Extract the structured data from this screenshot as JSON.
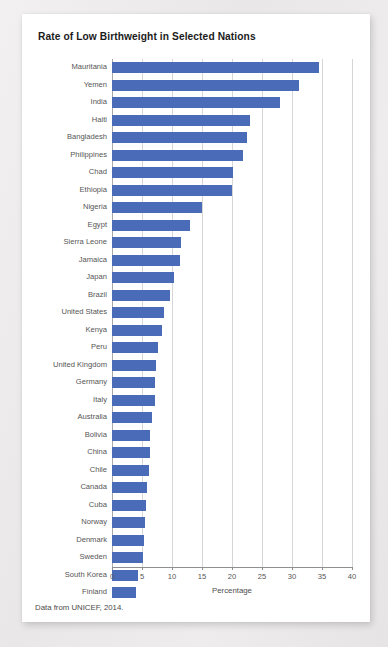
{
  "card": {
    "title": "Rate of Low Birthweight in Selected Nations",
    "source_note": "Data from UNICEF, 2014."
  },
  "colors": {
    "bar": "#4a6cb8",
    "grid": "#d6d6d6",
    "axis": "#8f8f8f",
    "label_text": "#555555",
    "card_background": "#ffffff",
    "page_background": "#eceaea"
  },
  "chart_data": {
    "type": "bar",
    "orientation": "horizontal",
    "title": "Rate of Low Birthweight in Selected Nations",
    "xlabel": "Percentage",
    "ylabel": "",
    "xlim": [
      0,
      40
    ],
    "xticks": [
      0,
      5,
      10,
      15,
      20,
      25,
      30,
      35,
      40
    ],
    "xtick_labels": [
      "0",
      "5",
      "10",
      "15",
      "20",
      "25",
      "30",
      "35",
      "40"
    ],
    "grid": "vertical",
    "legend": "none",
    "series_name": "Low birthweight rate",
    "categories": [
      "Mauritania",
      "Yemen",
      "India",
      "Haiti",
      "Bangladesh",
      "Philippines",
      "Chad",
      "Ethiopia",
      "Nigeria",
      "Egypt",
      "Sierra Leone",
      "Jamaica",
      "Japan",
      "Brazil",
      "United States",
      "Kenya",
      "Peru",
      "United Kingdom",
      "Germany",
      "Italy",
      "Australia",
      "Bolivia",
      "China",
      "Chile",
      "Canada",
      "Cuba",
      "Norway",
      "Denmark",
      "Sweden",
      "South Korea",
      "Finland"
    ],
    "values": [
      34.5,
      31.2,
      28.0,
      23.0,
      22.5,
      21.8,
      20.2,
      20.0,
      15.0,
      13.0,
      11.5,
      11.3,
      10.4,
      9.6,
      8.6,
      8.4,
      7.7,
      7.3,
      7.2,
      7.1,
      6.6,
      6.4,
      6.3,
      6.2,
      5.9,
      5.6,
      5.5,
      5.3,
      5.2,
      4.4,
      4.0
    ]
  }
}
